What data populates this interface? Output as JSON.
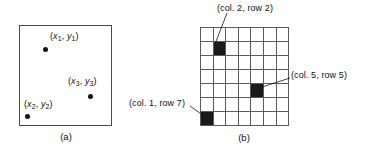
{
  "figure": {
    "panel_a": {
      "caption": "(a)",
      "points": [
        {
          "label_x": "x",
          "label_y": "y",
          "sub": "1",
          "text": "(x1, y1)"
        },
        {
          "label_x": "x",
          "label_y": "y",
          "sub": "2",
          "text": "(x2, y2)"
        },
        {
          "label_x": "x",
          "label_y": "y",
          "sub": "3",
          "text": "(x3, y3)"
        }
      ]
    },
    "panel_b": {
      "caption": "(b)",
      "grid": {
        "columns": 7,
        "rows": 7,
        "filled_cells": [
          {
            "col": 2,
            "row": 2
          },
          {
            "col": 5,
            "row": 5
          },
          {
            "col": 1,
            "row": 7
          }
        ]
      },
      "callouts": [
        {
          "id": "callout-col2-row2",
          "text": "(col. 2, row 2)"
        },
        {
          "id": "callout-col5-row5",
          "text": "(col. 5, row 5)"
        },
        {
          "id": "callout-col1-row7",
          "text": "(col. 1, row 7)"
        }
      ]
    },
    "colors": {
      "ink": "#111111",
      "grid_line": "#5a5a5a",
      "box_border": "#4a4a4a",
      "filled_cell": "#1a1a1a",
      "background": "#ffffff"
    }
  }
}
